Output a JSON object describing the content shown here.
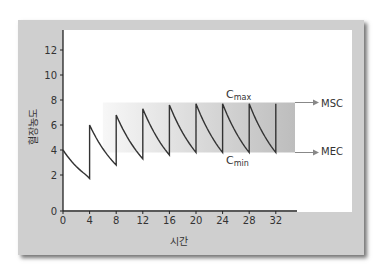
{
  "chart_data": {
    "type": "line",
    "title": "",
    "xlabel": "시간",
    "ylabel": "혈장농도",
    "xlim": [
      0,
      35
    ],
    "ylim": [
      0,
      13
    ],
    "xticks": [
      0,
      4,
      8,
      12,
      16,
      20,
      24,
      28,
      32
    ],
    "yticks": [
      0,
      2,
      4,
      6,
      8,
      10,
      12
    ],
    "grid": false,
    "series": [
      {
        "name": "plasma concentration (repeated dosing every 4 h)",
        "points": [
          [
            0,
            4.0
          ],
          [
            4,
            1.8
          ],
          [
            4,
            6.0
          ],
          [
            8,
            2.8
          ],
          [
            8,
            6.8
          ],
          [
            12,
            3.3
          ],
          [
            12,
            7.3
          ],
          [
            16,
            3.6
          ],
          [
            16,
            7.6
          ],
          [
            20,
            3.8
          ],
          [
            20,
            7.7
          ],
          [
            24,
            3.8
          ],
          [
            24,
            7.7
          ],
          [
            28,
            3.8
          ],
          [
            28,
            7.7
          ],
          [
            32,
            3.8
          ],
          [
            32,
            7.7
          ]
        ]
      }
    ],
    "annotations": {
      "band": {
        "label": "therapeutic range",
        "x_from": 6,
        "x_to": 35,
        "y_low": 3.8,
        "y_high": 7.8
      },
      "cmax_label": "C",
      "cmax_sub": "max",
      "cmin_label": "C",
      "cmin_sub": "min",
      "upper_line_label": "MSC",
      "lower_line_label": "MEC"
    }
  },
  "colors": {
    "frame": "#cfcfcf",
    "line": "#333333",
    "band_light": "#f2f2f2",
    "band_dark": "#b5b5b5",
    "arrow": "#888888"
  }
}
